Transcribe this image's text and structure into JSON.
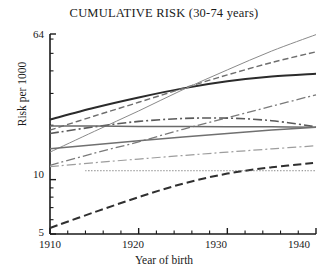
{
  "chart_data": {
    "type": "line",
    "title": "CUMULATIVE RISK (30-74 years)",
    "xlabel": "Year of birth",
    "ylabel": "Risk per 1000",
    "xlim": [
      1910,
      1940
    ],
    "ylim": [
      5,
      64
    ],
    "yscale": "log",
    "grid": false,
    "legend": "none",
    "xticks": [
      1910,
      1920,
      1930,
      1940
    ],
    "xtick_labels": [
      "1910",
      "1920",
      "1930",
      "1940"
    ],
    "xminor_step": 2,
    "yticks": [
      5,
      10,
      64
    ],
    "ytick_labels": [
      "5",
      "10",
      "64"
    ],
    "yminor_ticks": [
      6,
      7,
      8,
      9,
      20,
      30,
      40,
      50,
      60
    ],
    "x": [
      1910,
      1915,
      1920,
      1925,
      1930,
      1935,
      1940
    ],
    "series": [
      {
        "name": "series-1-solid-thick-dark",
        "style": "solid",
        "width": 2.0,
        "color": "#2b2b2b",
        "values": [
          21.5,
          25.0,
          28.5,
          32.0,
          35.0,
          37.2,
          38.5
        ]
      },
      {
        "name": "series-2-dashed-steep",
        "style": "dashed",
        "width": 1.4,
        "color": "#6e6e6e",
        "values": [
          18.8,
          22.5,
          26.8,
          32.0,
          38.0,
          44.5,
          51.0
        ]
      },
      {
        "name": "series-3-solid-thin-steepest",
        "style": "solid",
        "width": 1.0,
        "color": "#8a8a8a",
        "values": [
          14.2,
          18.5,
          24.0,
          31.5,
          40.5,
          51.5,
          63.5
        ]
      },
      {
        "name": "series-4-dashdot-rising",
        "style": "dashdot",
        "width": 1.3,
        "color": "#7a7a7a",
        "values": [
          12.0,
          14.0,
          16.2,
          19.0,
          22.0,
          25.5,
          29.5
        ]
      },
      {
        "name": "series-5-dashdot-flat-hump",
        "style": "dashdot",
        "width": 1.6,
        "color": "#5a5a5a",
        "values": [
          18.0,
          19.6,
          21.0,
          21.8,
          21.9,
          21.2,
          19.6
        ]
      },
      {
        "name": "series-6-solid-flat",
        "style": "solid",
        "width": 1.5,
        "color": "#6a6a6a",
        "values": [
          19.8,
          19.8,
          19.7,
          19.7,
          19.6,
          19.6,
          19.5
        ]
      },
      {
        "name": "series-7-solid-gentle-rise",
        "style": "solid",
        "width": 1.5,
        "color": "#707070",
        "values": [
          14.8,
          15.6,
          16.4,
          17.2,
          18.0,
          18.8,
          19.5
        ]
      },
      {
        "name": "series-8-dashdot-light",
        "style": "dashdot",
        "width": 1.2,
        "color": "#9d9d9d",
        "values": [
          11.8,
          12.4,
          13.0,
          13.6,
          14.2,
          14.8,
          15.4
        ]
      },
      {
        "name": "series-9-dashed-bottom-curve",
        "style": "dashed-long",
        "width": 2.0,
        "color": "#2f2f2f",
        "values": [
          5.4,
          6.6,
          8.0,
          9.5,
          10.8,
          11.7,
          12.4
        ]
      },
      {
        "name": "series-10-dotted-horizontal",
        "style": "dotted",
        "width": 1.0,
        "color": "#555555",
        "x_start": 1914,
        "values": [
          11.2,
          11.2,
          11.2,
          11.2,
          11.2,
          11.2,
          11.2
        ]
      }
    ]
  }
}
